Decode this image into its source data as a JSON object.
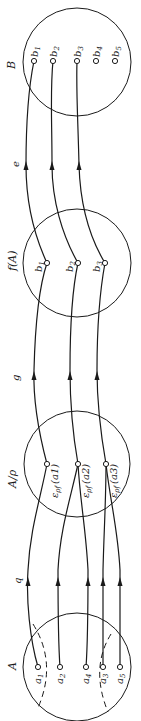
{
  "diagram": {
    "orientation": "rotated-90-ccw",
    "sets": {
      "A": {
        "label": "A",
        "elements": [
          "a1",
          "a2",
          "a4",
          "a3",
          "a5"
        ]
      },
      "quotient": {
        "label": "A/ρ",
        "elements": [
          "ερf(a1)",
          "ερf(a2)",
          "ερf(a3)"
        ]
      },
      "image": {
        "label": "f(A)",
        "elements": [
          "b1",
          "b2",
          "b3"
        ]
      },
      "B": {
        "label": "B",
        "elements": [
          "b1",
          "b2",
          "b3",
          "b4",
          "b5"
        ]
      }
    },
    "maps": {
      "q": {
        "label": "q"
      },
      "g": {
        "label": "g"
      },
      "e": {
        "label": "e"
      }
    },
    "labels": {
      "A": "A",
      "q": "q",
      "A_rho": "A/ρ",
      "g": "g",
      "fA": "f(A)",
      "e": "e",
      "B": "B",
      "a1": "a",
      "a1_sub": "1",
      "a2": "a",
      "a2_sub": "2",
      "a3": "a",
      "a3_sub": "3",
      "a4": "a",
      "a4_sub": "4",
      "a5": "a",
      "a5_sub": "5",
      "eps": "ε",
      "rho_f": "ρf",
      "cls1": "(a1)",
      "cls2": "(a2)",
      "cls3": "(a3)",
      "b": "b",
      "s1": "1",
      "s2": "2",
      "s3": "3",
      "s4": "4",
      "s5": "5"
    },
    "edges": [
      {
        "map": "q",
        "from": "a1",
        "to": "ερf(a1)"
      },
      {
        "map": "q",
        "from": "a2",
        "to": "ερf(a2)"
      },
      {
        "map": "q",
        "from": "a4",
        "to": "ερf(a2)"
      },
      {
        "map": "q",
        "from": "a3",
        "to": "ερf(a3)"
      },
      {
        "map": "q",
        "from": "a5",
        "to": "ερf(a3)"
      },
      {
        "map": "g",
        "from": "ερf(a1)",
        "to": "b1"
      },
      {
        "map": "g",
        "from": "ερf(a2)",
        "to": "b2"
      },
      {
        "map": "g",
        "from": "ερf(a3)",
        "to": "b3"
      },
      {
        "map": "e",
        "from": "b1",
        "to": "b1"
      },
      {
        "map": "e",
        "from": "b2",
        "to": "b2"
      },
      {
        "map": "e",
        "from": "b3",
        "to": "b3"
      }
    ]
  }
}
